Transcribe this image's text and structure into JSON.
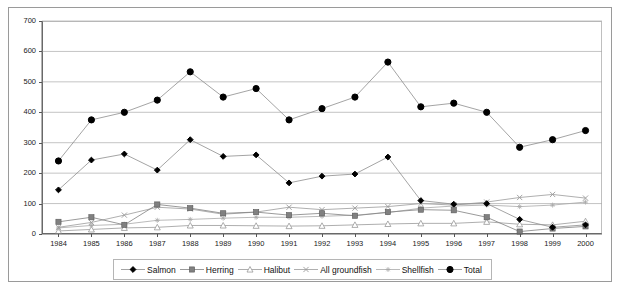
{
  "chart_data": {
    "type": "line",
    "title": "",
    "xlabel": "",
    "ylabel": "",
    "ylim": [
      0,
      700
    ],
    "yticks": [
      0,
      100,
      200,
      300,
      400,
      500,
      600,
      700
    ],
    "grid": true,
    "legend_position": "bottom",
    "categories": [
      "1984",
      "1985",
      "1986",
      "1987",
      "1988",
      "1989",
      "1990",
      "1991",
      "1992",
      "1993",
      "1994",
      "1995",
      "1996",
      "1997",
      "1998",
      "1999",
      "2000"
    ],
    "series": [
      {
        "name": "Salmon",
        "marker": "diamond",
        "color": "#000000",
        "values": [
          145,
          243,
          263,
          210,
          310,
          255,
          260,
          168,
          190,
          197,
          253,
          110,
          98,
          100,
          48,
          22,
          30
        ]
      },
      {
        "name": "Herring",
        "marker": "square",
        "color": "#808080",
        "values": [
          40,
          55,
          30,
          97,
          85,
          68,
          72,
          62,
          68,
          60,
          72,
          80,
          78,
          55,
          8,
          18,
          25
        ]
      },
      {
        "name": "Halibut",
        "marker": "triangle",
        "color": "#999999",
        "values": [
          10,
          15,
          20,
          22,
          28,
          28,
          27,
          26,
          27,
          30,
          33,
          35,
          35,
          40,
          32,
          30,
          42
        ]
      },
      {
        "name": "All groundfish",
        "marker": "cross",
        "color": "#9a9a9a",
        "values": [
          22,
          38,
          62,
          88,
          82,
          65,
          72,
          88,
          80,
          85,
          90,
          100,
          95,
          105,
          120,
          130,
          118
        ]
      },
      {
        "name": "Shellfish",
        "marker": "asterisk",
        "color": "#a8a8a8",
        "values": [
          20,
          28,
          32,
          45,
          48,
          52,
          55,
          55,
          58,
          62,
          70,
          85,
          92,
          95,
          90,
          95,
          105
        ]
      },
      {
        "name": "Total",
        "marker": "circle",
        "color": "#000000",
        "values": [
          240,
          375,
          400,
          440,
          533,
          450,
          478,
          375,
          412,
          450,
          565,
          418,
          430,
          400,
          285,
          310,
          340
        ]
      }
    ]
  }
}
